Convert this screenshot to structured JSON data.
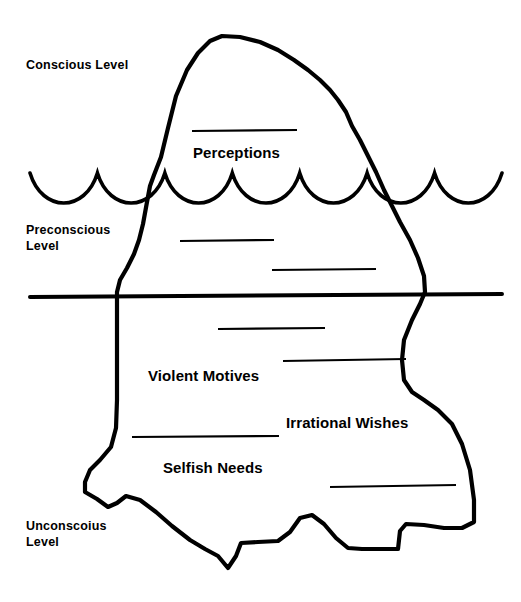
{
  "diagram": {
    "type": "iceberg-diagram",
    "line_color": "#000000",
    "background_color": "#ffffff",
    "levels": [
      {
        "id": "conscious",
        "label": "Conscious Level"
      },
      {
        "id": "preconscious",
        "label": "Preconscious\nLevel"
      },
      {
        "id": "unconscious",
        "label": "Unconscoius\nLevel"
      }
    ],
    "concepts": [
      {
        "id": "perceptions",
        "label": "Perceptions",
        "zone": "conscious"
      },
      {
        "id": "violent-motives",
        "label": "Violent Motives",
        "zone": "unconscious"
      },
      {
        "id": "irrational-wishes",
        "label": "Irrational Wishes",
        "zone": "unconscious"
      },
      {
        "id": "selfish-needs",
        "label": "Selfish Needs",
        "zone": "unconscious"
      }
    ],
    "blank_lines": [
      {
        "id": "blank-1",
        "zone": "conscious",
        "x1": 192,
        "y1": 131,
        "x2": 297,
        "y2": 130
      },
      {
        "id": "blank-2",
        "zone": "preconscious",
        "x1": 180,
        "y1": 241,
        "x2": 274,
        "y2": 240
      },
      {
        "id": "blank-3",
        "zone": "preconscious",
        "x1": 272,
        "y1": 270,
        "x2": 376,
        "y2": 269
      },
      {
        "id": "blank-4",
        "zone": "unconscious",
        "x1": 218,
        "y1": 329,
        "x2": 325,
        "y2": 328
      },
      {
        "id": "blank-5",
        "zone": "unconscious",
        "x1": 283,
        "y1": 361,
        "x2": 406,
        "y2": 359
      },
      {
        "id": "blank-6",
        "zone": "unconscious",
        "x1": 132,
        "y1": 437,
        "x2": 279,
        "y2": 436
      },
      {
        "id": "blank-7",
        "zone": "unconscious",
        "x1": 330,
        "y1": 487,
        "x2": 456,
        "y2": 485
      }
    ],
    "water_line": {
      "id": "water-surface",
      "style": "scalloped-waves",
      "arc_count": 7,
      "crest_y": 173,
      "trough_y": 205,
      "x_start": 30,
      "x_end": 502
    },
    "divider_line": {
      "id": "preconscious-unconscious-divider",
      "x1": 30,
      "y1": 297,
      "x2": 502,
      "y2": 294
    },
    "iceberg_outline": {
      "id": "iceberg-body",
      "path": "M 222 36 L 210 41 L 198 53 L 187 70 L 176 96 L 168 128 L 161 157 L 154 175 L 150 186 L 147 202 L 143 224 L 139 240 L 134 254 L 127 268 L 120 280 L 117 292 L 117 320 L 117 360 L 117 400 L 116 428 L 111 447 L 100 460 L 90 470 L 85 482 L 85 492 L 97 499 L 108 507 L 117 503 L 126 496 L 140 500 L 156 512 L 172 526 L 190 540 L 205 549 L 218 556 L 228 568 L 236 556 L 241 543 L 258 542 L 278 541 L 290 532 L 300 518 L 312 515 L 324 524 L 336 538 L 348 548 L 362 549 L 380 549 L 398 549 L 400 531 L 406 524 L 424 525 L 444 528 L 462 528 L 474 522 L 474 500 L 470 470 L 462 444 L 452 424 L 438 410 L 424 400 L 412 392 L 404 380 L 402 360 L 404 340 L 412 320 L 420 304 L 425 292 L 424 276 L 418 258 L 410 240 L 400 222 L 392 206 L 384 190 L 376 172 L 368 156 L 360 140 L 352 126 L 346 112 L 338 100 L 330 90 L 320 80 L 308 70 L 294 60 L 278 50 L 260 42 L 240 37 Z"
    }
  }
}
